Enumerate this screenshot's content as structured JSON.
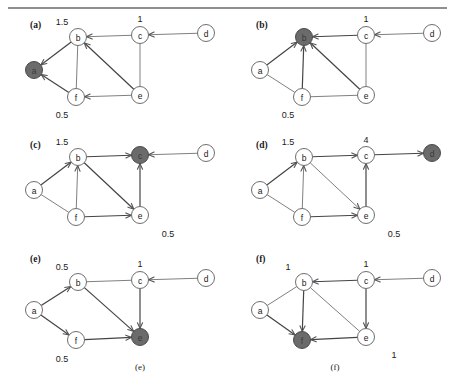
{
  "figure": {
    "width": 455,
    "height": 384,
    "top_rule": true,
    "bottom_captions": [
      {
        "text": "(e)",
        "x": 140,
        "y": 370
      },
      {
        "text": "(f)",
        "x": 335,
        "y": 370
      }
    ],
    "colors": {
      "highlight_node_fill": "#6b6b6b",
      "node_fill": "#ffffff",
      "node_stroke": "#6e6e6e",
      "edge": "#808080",
      "edge_dark": "#444444",
      "text": "#1a1a1a"
    }
  },
  "panels": [
    {
      "tag": "(a)",
      "tag_x": 30,
      "tag_y": 28,
      "origin_x": 0,
      "origin_y": 0,
      "highlight": "a",
      "nodes": [
        {
          "id": "a",
          "label": "a",
          "x": 34,
          "y": 70
        },
        {
          "id": "b",
          "label": "b",
          "x": 78,
          "y": 37
        },
        {
          "id": "c",
          "label": "c",
          "x": 140,
          "y": 35
        },
        {
          "id": "d",
          "label": "d",
          "x": 206,
          "y": 33
        },
        {
          "id": "e",
          "label": "e",
          "x": 140,
          "y": 95
        },
        {
          "id": "f",
          "label": "f",
          "x": 76,
          "y": 97
        }
      ],
      "edges": [
        {
          "from": "b",
          "to": "a",
          "arrow": true,
          "dark": true
        },
        {
          "from": "f",
          "to": "a",
          "arrow": true,
          "dark": true
        },
        {
          "from": "b",
          "to": "f",
          "arrow": false,
          "dark": false
        },
        {
          "from": "c",
          "to": "b",
          "arrow": true,
          "dark": false
        },
        {
          "from": "d",
          "to": "c",
          "arrow": true,
          "dark": false
        },
        {
          "from": "c",
          "to": "e",
          "arrow": false,
          "dark": false
        },
        {
          "from": "e",
          "to": "b",
          "arrow": true,
          "dark": true
        },
        {
          "from": "e",
          "to": "f",
          "arrow": true,
          "dark": false
        }
      ],
      "weights": [
        {
          "text": "1.5",
          "x": 62,
          "y": 25
        },
        {
          "text": "1",
          "x": 140,
          "y": 22
        },
        {
          "text": "0.5",
          "x": 62,
          "y": 118
        }
      ]
    },
    {
      "tag": "(b)",
      "tag_x": 256,
      "tag_y": 28,
      "origin_x": 226,
      "origin_y": 0,
      "highlight": "b",
      "nodes": [
        {
          "id": "a",
          "label": "a",
          "x": 260,
          "y": 70
        },
        {
          "id": "b",
          "label": "b",
          "x": 304,
          "y": 37
        },
        {
          "id": "c",
          "label": "c",
          "x": 366,
          "y": 35
        },
        {
          "id": "d",
          "label": "d",
          "x": 432,
          "y": 33
        },
        {
          "id": "e",
          "label": "e",
          "x": 366,
          "y": 95
        },
        {
          "id": "f",
          "label": "f",
          "x": 302,
          "y": 97
        }
      ],
      "edges": [
        {
          "from": "a",
          "to": "b",
          "arrow": true,
          "dark": true
        },
        {
          "from": "f",
          "to": "b",
          "arrow": true,
          "dark": true
        },
        {
          "from": "a",
          "to": "f",
          "arrow": false,
          "dark": false
        },
        {
          "from": "c",
          "to": "b",
          "arrow": true,
          "dark": true
        },
        {
          "from": "d",
          "to": "c",
          "arrow": true,
          "dark": false
        },
        {
          "from": "c",
          "to": "e",
          "arrow": false,
          "dark": false
        },
        {
          "from": "e",
          "to": "b",
          "arrow": true,
          "dark": true
        },
        {
          "from": "f",
          "to": "e",
          "arrow": false,
          "dark": false
        }
      ],
      "weights": [
        {
          "text": "1",
          "x": 366,
          "y": 22
        },
        {
          "text": "0.5",
          "x": 288,
          "y": 118
        }
      ]
    },
    {
      "tag": "(c)",
      "tag_x": 30,
      "tag_y": 148,
      "origin_x": 0,
      "origin_y": 120,
      "highlight": "c",
      "nodes": [
        {
          "id": "a",
          "label": "a",
          "x": 34,
          "y": 190
        },
        {
          "id": "b",
          "label": "b",
          "x": 78,
          "y": 157
        },
        {
          "id": "c",
          "label": "c",
          "x": 140,
          "y": 155
        },
        {
          "id": "d",
          "label": "d",
          "x": 206,
          "y": 153
        },
        {
          "id": "e",
          "label": "e",
          "x": 140,
          "y": 215
        },
        {
          "id": "f",
          "label": "f",
          "x": 76,
          "y": 217
        }
      ],
      "edges": [
        {
          "from": "a",
          "to": "b",
          "arrow": true,
          "dark": true
        },
        {
          "from": "f",
          "to": "b",
          "arrow": true,
          "dark": false
        },
        {
          "from": "a",
          "to": "f",
          "arrow": false,
          "dark": false
        },
        {
          "from": "b",
          "to": "c",
          "arrow": true,
          "dark": true
        },
        {
          "from": "d",
          "to": "c",
          "arrow": true,
          "dark": false
        },
        {
          "from": "e",
          "to": "c",
          "arrow": true,
          "dark": true
        },
        {
          "from": "b",
          "to": "e",
          "arrow": true,
          "dark": true
        },
        {
          "from": "f",
          "to": "e",
          "arrow": true,
          "dark": true
        }
      ],
      "weights": [
        {
          "text": "1.5",
          "x": 62,
          "y": 145
        },
        {
          "text": "0.5",
          "x": 168,
          "y": 237
        }
      ]
    },
    {
      "tag": "(d)",
      "tag_x": 256,
      "tag_y": 148,
      "origin_x": 226,
      "origin_y": 120,
      "highlight": "d",
      "nodes": [
        {
          "id": "a",
          "label": "a",
          "x": 260,
          "y": 190
        },
        {
          "id": "b",
          "label": "b",
          "x": 304,
          "y": 157
        },
        {
          "id": "c",
          "label": "c",
          "x": 366,
          "y": 155
        },
        {
          "id": "d",
          "label": "d",
          "x": 432,
          "y": 153
        },
        {
          "id": "e",
          "label": "e",
          "x": 366,
          "y": 215
        },
        {
          "id": "f",
          "label": "f",
          "x": 302,
          "y": 217
        }
      ],
      "edges": [
        {
          "from": "a",
          "to": "b",
          "arrow": true,
          "dark": true
        },
        {
          "from": "f",
          "to": "b",
          "arrow": true,
          "dark": false
        },
        {
          "from": "a",
          "to": "f",
          "arrow": false,
          "dark": false
        },
        {
          "from": "b",
          "to": "c",
          "arrow": true,
          "dark": true
        },
        {
          "from": "c",
          "to": "d",
          "arrow": true,
          "dark": true
        },
        {
          "from": "e",
          "to": "c",
          "arrow": true,
          "dark": true
        },
        {
          "from": "b",
          "to": "e",
          "arrow": true,
          "dark": false
        },
        {
          "from": "f",
          "to": "e",
          "arrow": true,
          "dark": true
        }
      ],
      "weights": [
        {
          "text": "1.5",
          "x": 288,
          "y": 145
        },
        {
          "text": "4",
          "x": 366,
          "y": 143
        },
        {
          "text": "0.5",
          "x": 394,
          "y": 237
        }
      ]
    },
    {
      "tag": "(e)",
      "tag_x": 30,
      "tag_y": 262,
      "origin_x": 0,
      "origin_y": 240,
      "highlight": "e",
      "nodes": [
        {
          "id": "a",
          "label": "a",
          "x": 34,
          "y": 310
        },
        {
          "id": "b",
          "label": "b",
          "x": 78,
          "y": 282
        },
        {
          "id": "c",
          "label": "c",
          "x": 140,
          "y": 280
        },
        {
          "id": "d",
          "label": "d",
          "x": 206,
          "y": 278
        },
        {
          "id": "e",
          "label": "e",
          "x": 140,
          "y": 337
        },
        {
          "id": "f",
          "label": "f",
          "x": 76,
          "y": 340
        }
      ],
      "edges": [
        {
          "from": "a",
          "to": "b",
          "arrow": true,
          "dark": true
        },
        {
          "from": "a",
          "to": "f",
          "arrow": true,
          "dark": true
        },
        {
          "from": "b",
          "to": "c",
          "arrow": false,
          "dark": false
        },
        {
          "from": "d",
          "to": "c",
          "arrow": true,
          "dark": false
        },
        {
          "from": "c",
          "to": "e",
          "arrow": true,
          "dark": true
        },
        {
          "from": "b",
          "to": "e",
          "arrow": true,
          "dark": true
        },
        {
          "from": "f",
          "to": "e",
          "arrow": true,
          "dark": true
        }
      ],
      "weights": [
        {
          "text": "0.5",
          "x": 62,
          "y": 270
        },
        {
          "text": "1",
          "x": 140,
          "y": 267
        },
        {
          "text": "0.5",
          "x": 62,
          "y": 362
        }
      ]
    },
    {
      "tag": "(f)",
      "tag_x": 256,
      "tag_y": 262,
      "origin_x": 226,
      "origin_y": 240,
      "highlight": "f",
      "nodes": [
        {
          "id": "a",
          "label": "a",
          "x": 260,
          "y": 310
        },
        {
          "id": "b",
          "label": "b",
          "x": 304,
          "y": 282
        },
        {
          "id": "c",
          "label": "c",
          "x": 366,
          "y": 280
        },
        {
          "id": "d",
          "label": "d",
          "x": 432,
          "y": 278
        },
        {
          "id": "e",
          "label": "e",
          "x": 366,
          "y": 337
        },
        {
          "id": "f",
          "label": "f",
          "x": 302,
          "y": 340
        }
      ],
      "edges": [
        {
          "from": "a",
          "to": "b",
          "arrow": false,
          "dark": false
        },
        {
          "from": "a",
          "to": "f",
          "arrow": true,
          "dark": true
        },
        {
          "from": "c",
          "to": "b",
          "arrow": true,
          "dark": true
        },
        {
          "from": "d",
          "to": "c",
          "arrow": true,
          "dark": false
        },
        {
          "from": "c",
          "to": "e",
          "arrow": true,
          "dark": true
        },
        {
          "from": "b",
          "to": "e",
          "arrow": false,
          "dark": false
        },
        {
          "from": "b",
          "to": "f",
          "arrow": true,
          "dark": true
        },
        {
          "from": "e",
          "to": "f",
          "arrow": true,
          "dark": true
        }
      ],
      "weights": [
        {
          "text": "1",
          "x": 288,
          "y": 270
        },
        {
          "text": "1",
          "x": 366,
          "y": 267
        },
        {
          "text": "1",
          "x": 394,
          "y": 358
        }
      ]
    }
  ]
}
